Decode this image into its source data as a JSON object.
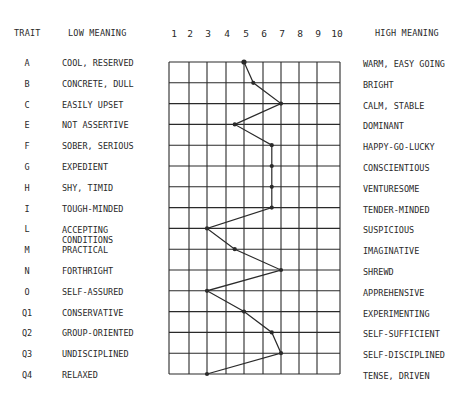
{
  "chart_data": {
    "type": "line",
    "title": "",
    "orientation": "vertical-profile",
    "headers": {
      "trait": "TRAIT",
      "low": "LOW MEANING",
      "high": "HIGH MEANING"
    },
    "scale": [
      "1",
      "2",
      "3",
      "4",
      "5",
      "6",
      "7",
      "8",
      "9",
      "10"
    ],
    "xlim": [
      1,
      10
    ],
    "grid": true,
    "traits": [
      {
        "code": "A",
        "low": "COOL, RESERVED",
        "high": "WARM, EASY GOING",
        "score": 5
      },
      {
        "code": "B",
        "low": "CONCRETE, DULL",
        "high": "BRIGHT",
        "score": 5.5
      },
      {
        "code": "C",
        "low": "EASILY UPSET",
        "high": "CALM, STABLE",
        "score": 7
      },
      {
        "code": "E",
        "low": "NOT ASSERTIVE",
        "high": "DOMINANT",
        "score": 4.5
      },
      {
        "code": "F",
        "low": "SOBER, SERIOUS",
        "high": "HAPPY-GO-LUCKY",
        "score": 6.5
      },
      {
        "code": "G",
        "low": "EXPEDIENT",
        "high": "CONSCIENTIOUS",
        "score": 6.5
      },
      {
        "code": "H",
        "low": "SHY, TIMID",
        "high": "VENTURESOME",
        "score": 6.5
      },
      {
        "code": "I",
        "low": "TOUGH-MINDED",
        "high": "TENDER-MINDED",
        "score": 6.5
      },
      {
        "code": "L",
        "low": "ACCEPTING CONDITIONS",
        "high": "SUSPICIOUS",
        "score": 3
      },
      {
        "code": "M",
        "low": "PRACTICAL",
        "high": "IMAGINATIVE",
        "score": 4.5
      },
      {
        "code": "N",
        "low": "FORTHRIGHT",
        "high": "SHREWD",
        "score": 7
      },
      {
        "code": "O",
        "low": "SELF-ASSURED",
        "high": "APPREHENSIVE",
        "score": 3
      },
      {
        "code": "Q1",
        "low": "CONSERVATIVE",
        "high": "EXPERIMENTING",
        "score": 5
      },
      {
        "code": "Q2",
        "low": "GROUP-ORIENTED",
        "high": "SELF-SUFFICIENT",
        "score": 6.5
      },
      {
        "code": "Q3",
        "low": "UNDISCIPLINED",
        "high": "SELF-DISCIPLINED",
        "score": 7
      },
      {
        "code": "Q4",
        "low": "RELAXED",
        "high": "TENSE, DRIVEN",
        "score": 3
      }
    ],
    "series": [
      {
        "name": "profile",
        "values": [
          5,
          5.5,
          7,
          4.5,
          6.5,
          6.5,
          6.5,
          6.5,
          3,
          4.5,
          7,
          3,
          5,
          6.5,
          7,
          3
        ]
      }
    ],
    "colors": {
      "ink": "#2a2a2a",
      "background": "#ffffff"
    }
  }
}
